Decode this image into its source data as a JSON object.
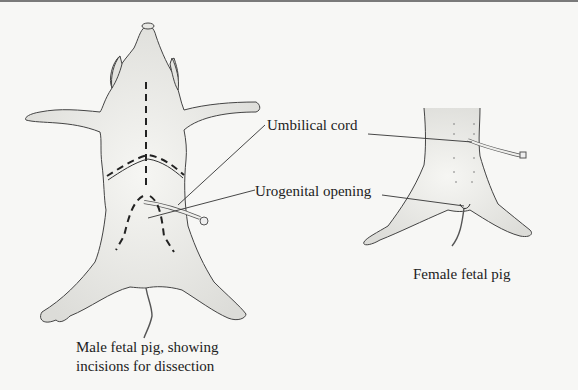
{
  "diagram": {
    "topic": "Fetal pig external anatomy",
    "figures": [
      {
        "id": "male",
        "caption_line1": "Male fetal pig, showing",
        "caption_line2": "incisions for dissection"
      },
      {
        "id": "female",
        "caption": "Female fetal pig"
      }
    ],
    "labels": {
      "umbilical_cord": "Umbilical cord",
      "urogenital_opening": "Urogenital opening"
    },
    "colors": {
      "background": "#f7f7f5",
      "ink": "#333333",
      "incision": "#222222",
      "body_fill": "#f2f2ef"
    }
  }
}
